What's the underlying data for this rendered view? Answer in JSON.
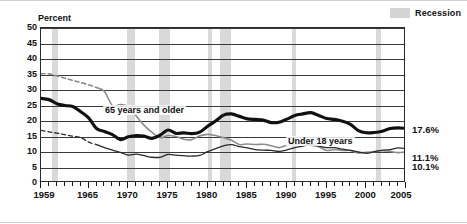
{
  "legend": {
    "recession_label": "Recession",
    "swatch_color": "#d9d9d9"
  },
  "axis": {
    "y_title": "Percent",
    "y_ticks": [
      "0",
      "5",
      "10",
      "15",
      "20",
      "25",
      "30",
      "35",
      "40",
      "45",
      "50"
    ],
    "x_labels": [
      "1959",
      "1965",
      "1970",
      "1975",
      "1980",
      "1985",
      "1990",
      "1995",
      "2000",
      "2005"
    ]
  },
  "annotations": {
    "older": "65 years and older",
    "under18": "Under 18 years",
    "adults": "18 to 64 years"
  },
  "end_labels": {
    "under18": "17.6%",
    "adults": "11.1%",
    "older": "10.1%"
  },
  "chart_data": {
    "type": "line",
    "title": "",
    "subtitle": "",
    "xlabel": "",
    "ylabel": "Percent",
    "xlim": [
      1959,
      2005
    ],
    "ylim": [
      0,
      50
    ],
    "y_tick_step": 5,
    "x_tick_step": 1,
    "x_label_years": [
      1959,
      1965,
      1970,
      1975,
      1980,
      1985,
      1990,
      1995,
      2000,
      2005
    ],
    "grid": "horizontal",
    "legend_position": "top-right",
    "x": [
      1959,
      1960,
      1961,
      1962,
      1963,
      1964,
      1965,
      1966,
      1967,
      1968,
      1969,
      1970,
      1971,
      1972,
      1973,
      1974,
      1975,
      1976,
      1977,
      1978,
      1979,
      1980,
      1981,
      1982,
      1983,
      1984,
      1985,
      1986,
      1987,
      1988,
      1989,
      1990,
      1991,
      1992,
      1993,
      1994,
      1995,
      1996,
      1997,
      1998,
      1999,
      2000,
      2001,
      2002,
      2003,
      2004,
      2005
    ],
    "series": [
      {
        "name": "65 years and older",
        "color": "#8c8c8c",
        "style": "solid-with-dashed-early-segment",
        "dashed_through_year": 1966,
        "end_value": 10.1,
        "end_label": "10.1%",
        "values": [
          35.2,
          35.2,
          34.5,
          33.8,
          33.1,
          32.4,
          31.7,
          30.8,
          29.5,
          25.0,
          25.3,
          24.6,
          21.6,
          18.6,
          16.3,
          14.6,
          15.3,
          15.0,
          14.1,
          14.0,
          15.2,
          15.7,
          15.3,
          14.6,
          13.8,
          12.4,
          12.6,
          12.4,
          12.5,
          12.0,
          11.4,
          12.2,
          12.4,
          12.9,
          12.2,
          11.7,
          10.5,
          10.8,
          10.5,
          10.5,
          9.7,
          9.9,
          10.1,
          10.4,
          10.2,
          9.8,
          10.1
        ]
      },
      {
        "name": "Under 18 years",
        "color": "#111111",
        "style": "solid-thick",
        "end_value": 17.6,
        "end_label": "17.6%",
        "values": [
          27.3,
          26.9,
          25.6,
          25.0,
          24.7,
          23.0,
          21.0,
          17.6,
          16.6,
          15.6,
          14.0,
          14.9,
          15.3,
          15.1,
          14.4,
          15.4,
          17.1,
          16.0,
          16.2,
          15.9,
          16.4,
          18.3,
          20.0,
          21.9,
          22.3,
          21.5,
          20.7,
          20.5,
          20.3,
          19.5,
          19.6,
          20.6,
          21.8,
          22.3,
          22.7,
          21.8,
          20.8,
          20.5,
          19.9,
          18.9,
          16.9,
          16.2,
          16.3,
          16.7,
          17.6,
          17.8,
          17.6
        ]
      },
      {
        "name": "18 to 64 years",
        "color": "#2a2a2a",
        "style": "solid-thin-with-dashed-early-segment",
        "dashed_through_year": 1966,
        "end_value": 11.1,
        "end_label": "11.1%",
        "values": [
          17.0,
          16.5,
          16.1,
          15.6,
          15.1,
          14.7,
          13.2,
          12.4,
          11.4,
          10.6,
          9.9,
          9.0,
          9.3,
          8.8,
          8.3,
          8.3,
          9.2,
          9.0,
          8.8,
          8.7,
          8.9,
          10.1,
          11.1,
          12.0,
          12.4,
          11.7,
          11.3,
          10.8,
          10.6,
          10.5,
          10.2,
          10.7,
          11.4,
          11.9,
          12.4,
          11.9,
          11.4,
          11.4,
          10.9,
          10.5,
          10.0,
          9.6,
          10.1,
          10.6,
          10.8,
          11.3,
          11.1
        ]
      }
    ],
    "recession_bands": [
      {
        "start": 1960.4,
        "end": 1961.2
      },
      {
        "start": 1969.9,
        "end": 1970.9
      },
      {
        "start": 1973.9,
        "end": 1975.2
      },
      {
        "start": 1980.1,
        "end": 1980.6
      },
      {
        "start": 1981.6,
        "end": 1982.9
      },
      {
        "start": 1990.6,
        "end": 1991.2
      },
      {
        "start": 2001.2,
        "end": 2001.9
      }
    ]
  }
}
